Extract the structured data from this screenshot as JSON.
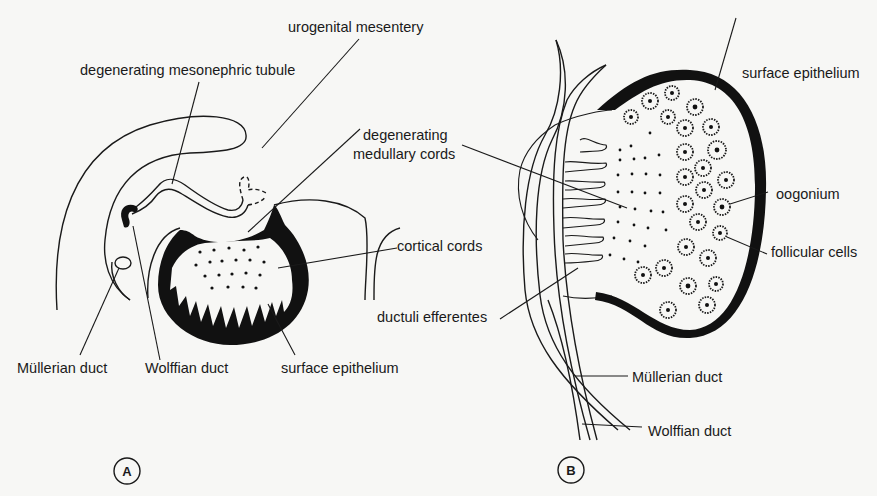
{
  "figure": {
    "panel_a": {
      "letter": "A",
      "labels": {
        "urogenital_mesentery": "urogenital mesentery",
        "degenerating_mesonephric_tubule": "degenerating mesonephric tubule",
        "degenerating_medullary_cords_line1": "degenerating",
        "degenerating_medullary_cords_line2": "medullary cords",
        "cortical_cords": "cortical cords",
        "mullerian_duct": "Müllerian duct",
        "wolffian_duct": "Wolffian duct",
        "surface_epithelium": "surface epithelium"
      }
    },
    "panel_b": {
      "letter": "B",
      "labels": {
        "surface_epithelium": "surface epithelium",
        "oogonium": "oogonium",
        "follicular_cells": "follicular cells",
        "ductuli_efferentes": "ductuli efferentes",
        "mullerian_duct": "Müllerian duct",
        "wolffian_duct": "Wolffian duct"
      }
    }
  }
}
